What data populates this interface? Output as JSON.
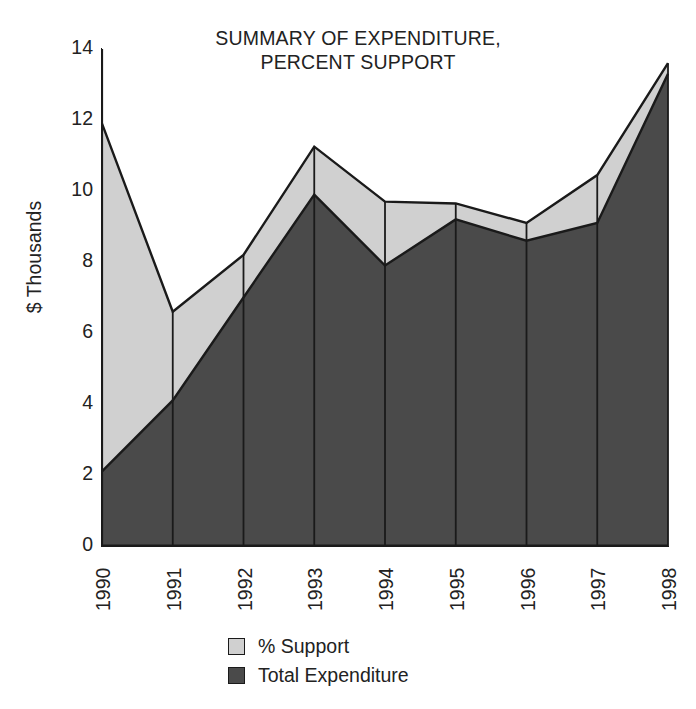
{
  "chart_data": {
    "type": "area",
    "title": "SUMMARY OF EXPENDITURE,\nPERCENT SUPPORT",
    "xlabel": "",
    "ylabel": "$ Thousands",
    "categories": [
      "1990",
      "1991",
      "1992",
      "1993",
      "1994",
      "1995",
      "1996",
      "1997",
      "1998"
    ],
    "series": [
      {
        "name": "Total Expenditure",
        "color": "#4a4a4a",
        "values": [
          2.1,
          4.1,
          7.0,
          9.9,
          7.9,
          9.2,
          8.6,
          9.1,
          13.3
        ]
      },
      {
        "name": "% Support",
        "color": "#d0d0d0",
        "values": [
          9.8,
          2.5,
          1.2,
          1.35,
          1.8,
          0.45,
          0.5,
          1.35,
          0.3
        ]
      }
    ],
    "stacked_totals": [
      11.9,
      6.6,
      8.2,
      11.25,
      9.7,
      9.65,
      9.1,
      10.45,
      13.6
    ],
    "ylim": [
      0,
      14
    ],
    "yticks": [
      "0",
      "2",
      "4",
      "6",
      "8",
      "10",
      "12",
      "14"
    ],
    "grid": false,
    "stacked": true,
    "legend_position": "bottom",
    "legend": [
      {
        "label": "% Support",
        "color": "#d0d0d0"
      },
      {
        "label": "Total Expenditure",
        "color": "#4a4a4a"
      }
    ],
    "axis_color": "#1a1a1a",
    "outline_color": "#1a1a1a"
  }
}
